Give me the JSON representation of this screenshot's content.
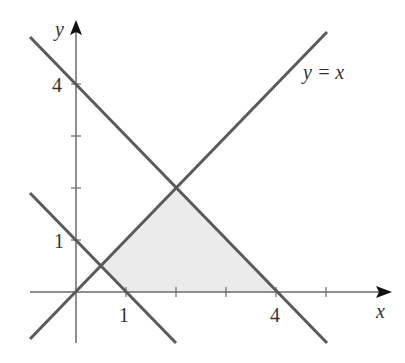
{
  "figure": {
    "type": "region-diagram",
    "colors": {
      "line": "#5a5a5a",
      "axis": "#6a6a6a",
      "shade": "#ebebeb",
      "text": "#333333"
    },
    "axes": {
      "x_label": "x",
      "y_label": "y",
      "x_ticks": [
        1,
        2,
        3,
        4,
        5
      ],
      "y_ticks": [
        1,
        2,
        3,
        4
      ],
      "x_tick_labels": {
        "1": "1",
        "4": "4"
      },
      "y_tick_labels": {
        "1": "1",
        "4": "4"
      }
    },
    "lines": [
      {
        "name": "y=x",
        "label": "y = x"
      },
      {
        "name": "x+y=4",
        "label": ""
      },
      {
        "name": "x+y=1",
        "label": ""
      }
    ],
    "shaded_region": {
      "vertices": [
        [
          0.5,
          0.5
        ],
        [
          2,
          2
        ],
        [
          4,
          0
        ],
        [
          1,
          0
        ]
      ]
    }
  },
  "labels": {
    "x_axis": "x",
    "y_axis": "y",
    "tick_x_1": "1",
    "tick_x_4": "4",
    "tick_y_1": "1",
    "tick_y_4": "4",
    "line_yx": "y = x"
  }
}
